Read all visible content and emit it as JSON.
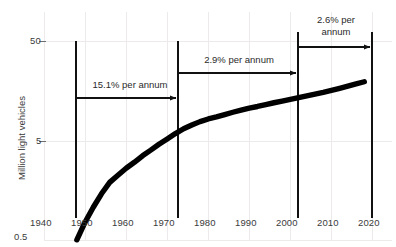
{
  "chart_data": {
    "type": "line",
    "title": "",
    "xlabel": "",
    "ylabel": "Million light vehicles",
    "yscale": "log",
    "ylim": [
      0.5,
      50
    ],
    "xlim": [
      1940,
      2020
    ],
    "grid": true,
    "legend": "none",
    "y_ticks": [
      "50",
      "5",
      "0.5"
    ],
    "y_tick_values": [
      50,
      5,
      0.5
    ],
    "x_ticks": [
      "1940",
      "1950",
      "1960",
      "1970",
      "1980",
      "1990",
      "2000",
      "2010",
      "2020"
    ],
    "x_tick_values": [
      1940,
      1950,
      1960,
      1970,
      1980,
      1990,
      2000,
      2010,
      2020
    ],
    "series": [
      {
        "name": "Million light vehicles",
        "x": [
          1948,
          1950,
          1952,
          1954,
          1956,
          1958,
          1960,
          1962,
          1964,
          1966,
          1968,
          1970,
          1972,
          1974,
          1976,
          1978,
          1980,
          1982,
          1984,
          1986,
          1988,
          1990,
          1992,
          1994,
          1996,
          1998,
          2000,
          2002,
          2004,
          2006,
          2008,
          2010,
          2012,
          2014,
          2016,
          2018
        ],
        "y": [
          0.52,
          0.78,
          1.1,
          1.5,
          1.95,
          2.3,
          2.7,
          3.1,
          3.6,
          4.1,
          4.7,
          5.3,
          6.0,
          6.7,
          7.3,
          7.9,
          8.4,
          8.8,
          9.3,
          9.8,
          10.3,
          10.8,
          11.2,
          11.7,
          12.2,
          12.7,
          13.2,
          13.7,
          14.3,
          14.9,
          15.5,
          16.2,
          17.0,
          17.9,
          18.8,
          19.8
        ]
      }
    ],
    "annotations": [
      {
        "label": "15.1% per annum",
        "from": 1948,
        "to": 1972,
        "lines": [
          "15.1% per annum"
        ]
      },
      {
        "label": "2.9% per annum",
        "from": 1972,
        "to": 2000,
        "lines": [
          "2.9% per annum"
        ]
      },
      {
        "label": "2.6% per annum",
        "from": 2000,
        "to": 2019,
        "lines": [
          "2.6% per",
          "annum"
        ]
      }
    ],
    "dividers": [
      1948,
      1972,
      2000,
      2019
    ],
    "colors": {
      "line": "#000000",
      "annotation": "#2b2b2b",
      "grid": "#eceaea",
      "tick_text": "#3b3b3b",
      "background": "#ffffff"
    }
  }
}
